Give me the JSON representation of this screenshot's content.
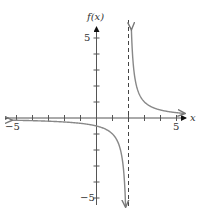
{
  "chart_data": {
    "type": "line",
    "title": "",
    "xlabel": "x",
    "ylabel": "f(x)",
    "xlim": [
      -5.3,
      5.5
    ],
    "ylim": [
      -5.3,
      5.6
    ],
    "x_tick_labels": [
      "-5",
      "5"
    ],
    "y_tick_labels": [
      "5",
      "-5"
    ],
    "grid": false,
    "function": "f(x) = 1/(x - 2)",
    "asymptotes": {
      "vertical": 2,
      "horizontal": 0
    },
    "series": [
      {
        "name": "left branch",
        "x": [
          -5.3,
          -4,
          -3,
          -2,
          -1,
          0,
          1,
          1.5,
          1.8,
          1.82
        ],
        "y": [
          -0.14,
          -0.17,
          -0.2,
          -0.25,
          -0.33,
          -0.5,
          -1,
          -2,
          -5,
          -5.5
        ]
      },
      {
        "name": "right branch",
        "x": [
          2.18,
          2.2,
          2.5,
          3,
          4,
          5,
          5.5
        ],
        "y": [
          5.5,
          5,
          2,
          1,
          0.5,
          0.33,
          0.29
        ]
      }
    ]
  },
  "axes": {
    "x_label": "x",
    "y_label": "f(x)",
    "x_min_label": "−5",
    "x_max_label": "5",
    "y_max_label": "5",
    "y_min_label": "−5"
  }
}
